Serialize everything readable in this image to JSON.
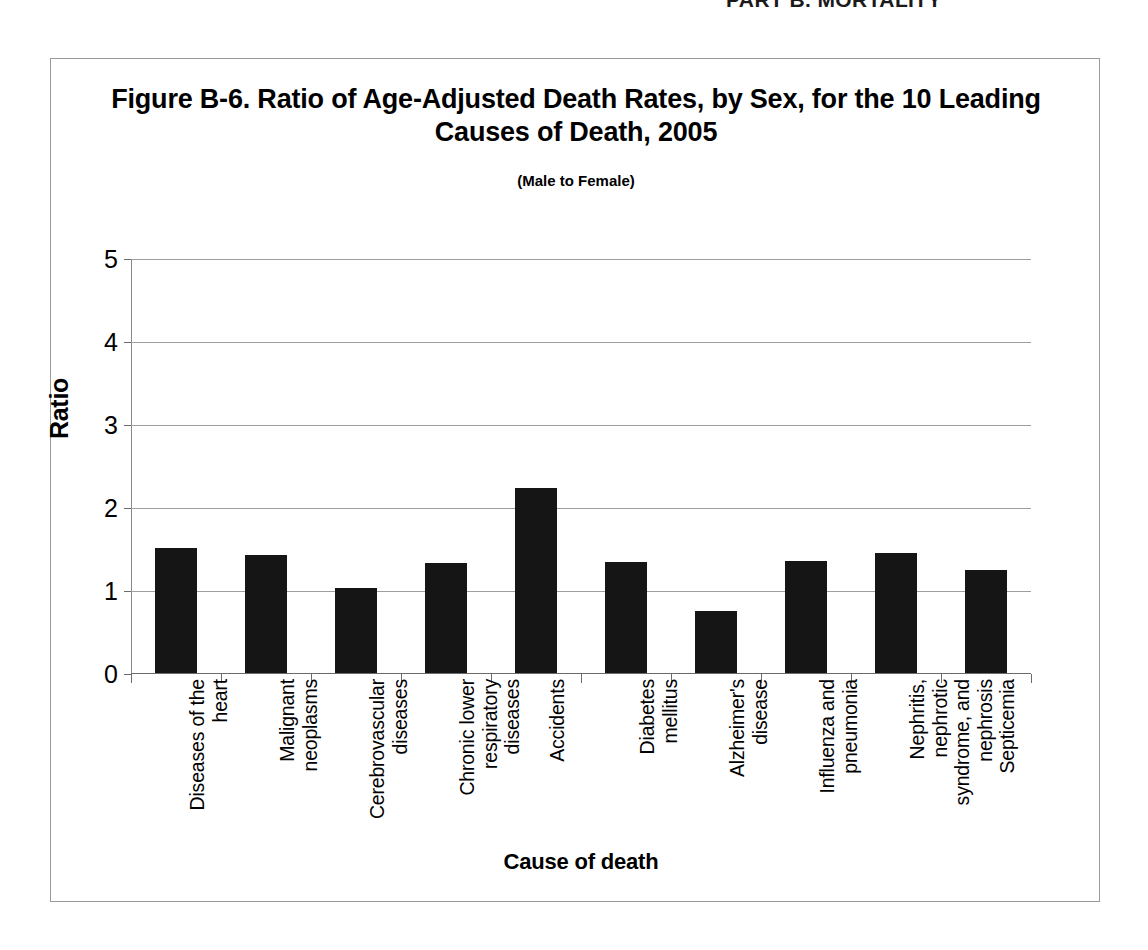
{
  "page_header": "PART B. MORTALITY",
  "figure": {
    "title": "Figure B-6. Ratio of Age-Adjusted Death Rates, by Sex, for the 10 Leading Causes of Death, 2005",
    "subtitle": "(Male to Female)"
  },
  "chart_data": {
    "type": "bar",
    "title": "Figure B-6. Ratio of Age-Adjusted Death Rates, by Sex, for the 10 Leading Causes of Death, 2005",
    "subtitle": "(Male to Female)",
    "xlabel": "Cause of death",
    "ylabel": "Ratio",
    "ylim": [
      0,
      5
    ],
    "yticks": [
      "0",
      "1",
      "2",
      "3",
      "4",
      "5"
    ],
    "ytick_values": [
      0,
      1,
      2,
      3,
      4,
      5
    ],
    "grid": true,
    "legend": null,
    "bar_color": "#151515",
    "categories": [
      "Diseases of the heart",
      "Malignant neoplasms",
      "Cerebrovascular diseases",
      "Chronic lower respiratory diseases",
      "Accidents",
      "Diabetes mellitus",
      "Alzheimer's disease",
      "Influenza and pneumonia",
      "Nephritis, nephrotic syndrome, and nephrosis",
      "Septicemia"
    ],
    "category_label_lines": [
      "Diseases of the\nheart",
      "Malignant\nneoplasms",
      "Cerebrovascular\ndiseases",
      "Chronic lower\nrespiratory\ndiseases",
      "Accidents",
      "Diabetes\nmellitus",
      "Alzheimer's\ndisease",
      "Influenza and\npneumonia",
      "Nephritis,\nnephrotic\nsyndrome, and\nnephrosis",
      "Septicemia"
    ],
    "values": [
      1.51,
      1.42,
      1.02,
      1.33,
      2.23,
      1.34,
      0.75,
      1.35,
      1.45,
      1.24
    ]
  }
}
